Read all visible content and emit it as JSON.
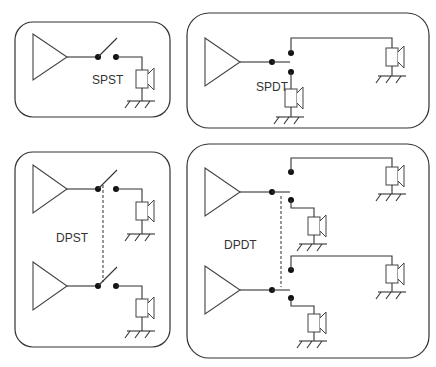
{
  "panels": [
    {
      "id": "spst",
      "label": "SPST",
      "description": "Single-pole single-throw: one amplifier, one switch, one speaker"
    },
    {
      "id": "spdt",
      "label": "SPDT",
      "description": "Single-pole double-throw: one amplifier, switch to two speakers"
    },
    {
      "id": "dpst",
      "label": "DPST",
      "description": "Double-pole single-throw: two amplifiers, ganged switches, two speakers"
    },
    {
      "id": "dpdt",
      "label": "DPDT",
      "description": "Double-pole double-throw: two amplifiers, ganged switches, four speakers"
    }
  ],
  "symbols": {
    "amplifier": "triangle-amplifier-icon",
    "speaker": "speaker-icon",
    "ground": "ground-icon",
    "switch_contact": "contact-dot",
    "mechanical_link": "dashed-link"
  },
  "colors": {
    "line": "#333333",
    "background": "#ffffff"
  }
}
